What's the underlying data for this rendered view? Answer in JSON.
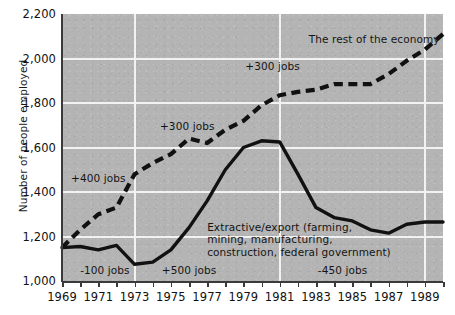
{
  "chart_data": {
    "type": "line",
    "title": "",
    "subtitle": "",
    "xlabel": "",
    "ylabel": "Number of people employed",
    "xlim": [
      1969,
      1990
    ],
    "ylim": [
      1000,
      2200
    ],
    "ytick_labels": [
      "2,200",
      "2,000",
      "1,800",
      "1,600",
      "1,400",
      "1,200",
      "1,000"
    ],
    "ytick_values": [
      2200,
      2000,
      1800,
      1600,
      1400,
      1200,
      1000
    ],
    "xtick_labels": [
      "1969",
      "1971",
      "1973",
      "1975",
      "1977",
      "1979",
      "1981",
      "1983",
      "1985",
      "1987",
      "1989"
    ],
    "xtick_values": [
      1969,
      1971,
      1973,
      1975,
      1977,
      1979,
      1981,
      1983,
      1985,
      1987,
      1989
    ],
    "minor_xticks": [
      1970,
      1972,
      1974,
      1976,
      1978,
      1980,
      1982,
      1984,
      1986,
      1988,
      1990
    ],
    "grid": true,
    "gridlines_y": [
      2000,
      1800,
      1600,
      1400,
      1200
    ],
    "gridlines_x": [
      1973,
      1981,
      1989
    ],
    "legend_position": "inline-annotations",
    "plot_background": "#b4b4b4",
    "series": [
      {
        "name": "The rest of the economy",
        "style": "dashed",
        "color": "#111111",
        "x": [
          1969,
          1970,
          1971,
          1972,
          1973,
          1974,
          1975,
          1976,
          1977,
          1978,
          1979,
          1980,
          1981,
          1982,
          1983,
          1984,
          1985,
          1986,
          1987,
          1988,
          1989,
          1990
        ],
        "values": [
          1150,
          1230,
          1300,
          1330,
          1480,
          1530,
          1570,
          1640,
          1620,
          1680,
          1720,
          1790,
          1835,
          1850,
          1860,
          1885,
          1885,
          1885,
          1930,
          1990,
          2040,
          2110
        ]
      },
      {
        "name": "Extractive/export (farming, mining, manufacturing, construction, federal government)",
        "style": "solid",
        "color": "#111111",
        "x": [
          1969,
          1970,
          1971,
          1972,
          1973,
          1974,
          1975,
          1976,
          1977,
          1978,
          1979,
          1980,
          1981,
          1982,
          1983,
          1984,
          1985,
          1986,
          1987,
          1988,
          1989,
          1990
        ],
        "values": [
          1150,
          1155,
          1140,
          1160,
          1075,
          1085,
          1140,
          1240,
          1360,
          1500,
          1600,
          1630,
          1625,
          1480,
          1330,
          1285,
          1270,
          1230,
          1215,
          1255,
          1265,
          1265
        ]
      }
    ],
    "annotations": [
      {
        "id": "rest-of-economy-label",
        "text": "The rest of the economy",
        "x": 1982.6,
        "y": 2085
      },
      {
        "id": "plus-300-upper",
        "text": "+300 jobs",
        "x": 1979.1,
        "y": 1960
      },
      {
        "id": "plus-300-lower",
        "text": "+300 jobs",
        "x": 1974.4,
        "y": 1690
      },
      {
        "id": "plus-400",
        "text": "+400 jobs",
        "x": 1969.5,
        "y": 1460
      },
      {
        "id": "extractive-label",
        "text": "Extractive/export (farming,\nmining, manufacturing,\nconstruction, federal government)",
        "x": 1977.0,
        "y": 1240
      },
      {
        "id": "minus-100",
        "text": "-100 jobs",
        "x": 1970.0,
        "y": 1045
      },
      {
        "id": "plus-500",
        "text": "+500 jobs",
        "x": 1974.5,
        "y": 1045
      },
      {
        "id": "minus-450",
        "text": "-450 jobs",
        "x": 1983.1,
        "y": 1045
      }
    ]
  }
}
